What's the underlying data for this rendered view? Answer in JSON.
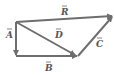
{
  "diagram": {
    "color": "#6e6e6e",
    "label_color": "#555555",
    "vectors": [
      {
        "name": "A",
        "label": "A",
        "from": [
          16,
          22
        ],
        "to": [
          16,
          55
        ],
        "label_pos": [
          8,
          36
        ]
      },
      {
        "name": "B",
        "label": "B",
        "from": [
          16,
          56
        ],
        "to": [
          77,
          56
        ],
        "label_pos": [
          47,
          70
        ]
      },
      {
        "name": "C",
        "label": "C",
        "from": [
          78,
          56
        ],
        "to": [
          112,
          17
        ],
        "label_pos": [
          97,
          46
        ]
      },
      {
        "name": "D",
        "label": "D",
        "from": [
          16,
          22
        ],
        "to": [
          75,
          55
        ],
        "label_pos": [
          56,
          37
        ]
      },
      {
        "name": "R",
        "label": "R",
        "from": [
          16,
          22
        ],
        "to": [
          112,
          16
        ],
        "label_pos": [
          62,
          15
        ]
      }
    ]
  }
}
